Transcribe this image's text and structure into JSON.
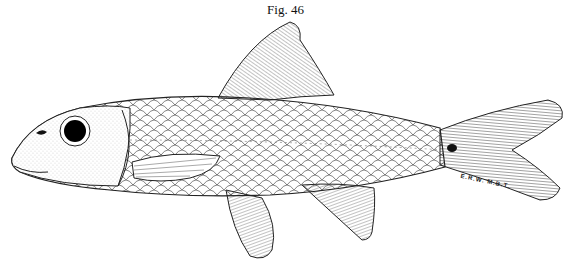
{
  "figure": {
    "caption": "Fig. 46",
    "signature": "E.R.W.   M.B.T.",
    "colors": {
      "ink": "#1a1a1a",
      "background": "#ffffff",
      "eye": "#000000"
    }
  }
}
